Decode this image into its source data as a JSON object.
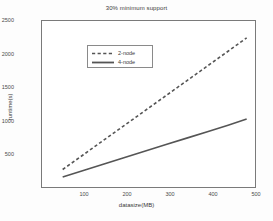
{
  "chart_data": {
    "type": "line",
    "title": "30% minimum support",
    "xlabel": "datasize(MB)",
    "ylabel": "runtime(s)",
    "xlim": [
      0,
      520
    ],
    "ylim": [
      0,
      2500
    ],
    "xticks": [
      100,
      200,
      300,
      400,
      500
    ],
    "yticks": [
      500,
      1000,
      1500,
      2000,
      2500
    ],
    "grid": false,
    "legend_position": "top-left",
    "series": [
      {
        "name": "2-node",
        "style": "dashed",
        "color": "#555555",
        "x": [
          50,
          100,
          150,
          200,
          250,
          300,
          350,
          400,
          450,
          495
        ],
        "y": [
          290,
          510,
          730,
          950,
          1170,
          1390,
          1610,
          1830,
          2050,
          2250
        ]
      },
      {
        "name": "4-node",
        "style": "solid",
        "color": "#555555",
        "x": [
          50,
          100,
          150,
          200,
          250,
          300,
          350,
          400,
          450,
          495
        ],
        "y": [
          180,
          275,
          372,
          468,
          565,
          661,
          757,
          853,
          950,
          1040
        ]
      }
    ]
  },
  "legend": {
    "entries": [
      {
        "label": "2-node",
        "style": "dashed"
      },
      {
        "label": "4-node",
        "style": "solid"
      }
    ]
  },
  "axes": {
    "ytick_labels": [
      "500",
      "1000",
      "1500",
      "2000",
      "2500"
    ],
    "xtick_labels": [
      "100",
      "200",
      "300",
      "400",
      "500"
    ]
  }
}
